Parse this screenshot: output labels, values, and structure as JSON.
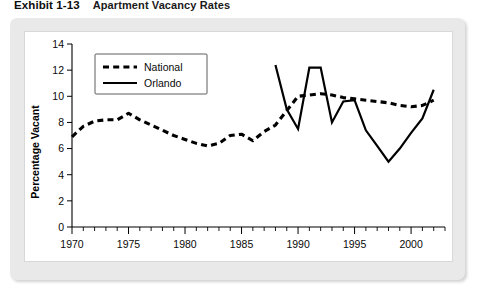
{
  "exhibit": {
    "label": "Exhibit 1-13",
    "title": "Apartment Vacancy Rates"
  },
  "chart_data": {
    "type": "line",
    "title": "Apartment Vacancy Rates",
    "xlabel": "",
    "ylabel": "Percentage Vacant",
    "xlim": [
      1970,
      2003
    ],
    "ylim": [
      0,
      14
    ],
    "ytick_step": 2,
    "yticks": [
      0,
      2,
      4,
      6,
      8,
      10,
      12,
      14
    ],
    "ytick_labels": [
      "0",
      "2",
      "4",
      "6",
      "8",
      "10",
      "12",
      "14"
    ],
    "xticks": [
      1970,
      1975,
      1980,
      1985,
      1990,
      1995,
      2000
    ],
    "xtick_labels": [
      "1970",
      "1975",
      "1980",
      "1985",
      "1990",
      "1995",
      "2000"
    ],
    "minor_xticks_every": 1,
    "grid": false,
    "legend_position": "upper-left",
    "series": [
      {
        "name": "National",
        "style": "dashed",
        "color": "#000000",
        "x": [
          1970,
          1971,
          1972,
          1973,
          1974,
          1975,
          1976,
          1977,
          1978,
          1979,
          1980,
          1981,
          1982,
          1983,
          1984,
          1985,
          1986,
          1987,
          1988,
          1989,
          1990,
          1991,
          1992,
          1993,
          1994,
          1995,
          1996,
          1997,
          1998,
          1999,
          2000,
          2001,
          2002
        ],
        "values": [
          6.9,
          7.7,
          8.1,
          8.2,
          8.2,
          8.7,
          8.2,
          7.8,
          7.4,
          7.0,
          6.7,
          6.4,
          6.2,
          6.4,
          7.0,
          7.1,
          6.6,
          7.3,
          7.8,
          8.9,
          10.0,
          10.1,
          10.2,
          10.1,
          9.9,
          9.8,
          9.7,
          9.6,
          9.5,
          9.3,
          9.2,
          9.3,
          9.7
        ]
      },
      {
        "name": "Orlando",
        "style": "solid",
        "color": "#000000",
        "x": [
          1988,
          1989,
          1990,
          1991,
          1992,
          1993,
          1994,
          1995,
          1996,
          1997,
          1998,
          1999,
          2000,
          2001,
          2002
        ],
        "values": [
          12.4,
          9.0,
          7.5,
          12.2,
          12.2,
          8.0,
          9.6,
          9.7,
          7.4,
          6.2,
          5.0,
          6.0,
          7.2,
          8.3,
          10.5
        ]
      }
    ]
  },
  "legend": {
    "entries": [
      {
        "label": "National",
        "style": "dashed"
      },
      {
        "label": "Orlando",
        "style": "solid"
      }
    ]
  }
}
